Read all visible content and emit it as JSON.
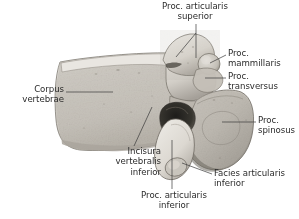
{
  "figure": {
    "kind": "anatomical-illustration",
    "background_color": "#ffffff",
    "text_color": "#2b2b2b",
    "bone_color": "#d9d6d0",
    "bone_shadow_color": "#9a968e",
    "leader_line_color": "#3a3a3a"
  },
  "labels": {
    "proc_articularis_superior": "Proc. articularis\nsuperior",
    "proc_mammillaris": "Proc.\nmammillaris",
    "proc_transversus": "Proc.\ntransversus",
    "proc_spinosus": "Proc.\nspinosus",
    "corpus_vertebrae": "Corpus\nvertebrae",
    "incisura_vertebralis_inferior": "Incisura\nvertebralis\ninferior",
    "proc_articularis_inferior": "Proc. articularis\ninferior",
    "facies_articularis_inferior": "Facies articularis\ninferior"
  },
  "structures": [
    {
      "name": "corpus-vertebrae",
      "label_key": "corpus_vertebrae"
    },
    {
      "name": "proc-articularis-superior",
      "label_key": "proc_articularis_superior"
    },
    {
      "name": "proc-mammillaris",
      "label_key": "proc_mammillaris"
    },
    {
      "name": "proc-transversus",
      "label_key": "proc_transversus"
    },
    {
      "name": "proc-spinosus",
      "label_key": "proc_spinosus"
    },
    {
      "name": "incisura-vertebralis-inferior",
      "label_key": "incisura_vertebralis_inferior"
    },
    {
      "name": "proc-articularis-inferior",
      "label_key": "proc_articularis_inferior"
    },
    {
      "name": "facies-articularis-inferior",
      "label_key": "facies_articularis_inferior"
    }
  ]
}
